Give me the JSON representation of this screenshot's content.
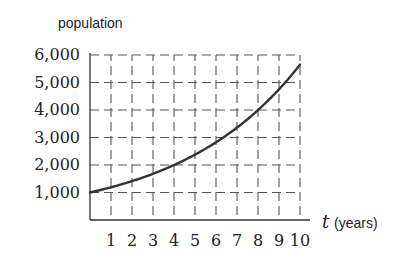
{
  "chart_data": {
    "type": "line",
    "title": "",
    "ylabel": "population",
    "xlabel": "t (years)",
    "x_var": "t",
    "x_unit": "(years)",
    "xlim": [
      0,
      10
    ],
    "ylim": [
      0,
      6000
    ],
    "grid": true,
    "grid_style": "dashed",
    "legend": "none",
    "x_ticks": [
      1,
      2,
      3,
      4,
      5,
      6,
      7,
      8,
      9,
      10
    ],
    "x_tick_labels": [
      "1",
      "2",
      "3",
      "4",
      "5",
      "6",
      "7",
      "8",
      "9",
      "10"
    ],
    "y_ticks": [
      1000,
      2000,
      3000,
      4000,
      5000,
      6000
    ],
    "y_tick_labels": [
      "1,000",
      "2,000",
      "3,000",
      "4,000",
      "5,000",
      "6,000"
    ],
    "series": [
      {
        "name": "population",
        "x": [
          0,
          1,
          2,
          3,
          4,
          5,
          6,
          7,
          8,
          9,
          10
        ],
        "values": [
          1000,
          1190,
          1410,
          1680,
          2000,
          2380,
          2830,
          3360,
          4000,
          4750,
          5650
        ],
        "color": "#333333"
      }
    ]
  }
}
